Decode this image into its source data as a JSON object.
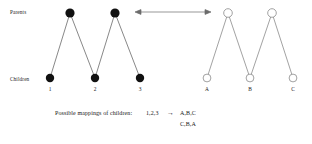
{
  "figure": {
    "row_labels": {
      "parents": "Parents",
      "children": "Children"
    },
    "relation_arrow": "double-headed-arrow",
    "left_graph": {
      "name": "numbered-pedigree",
      "node_style": "filled",
      "node_color": "#111111",
      "edge_color": "#555555",
      "parents": [
        {
          "id": "p1",
          "label": "",
          "x": 70,
          "y": 13
        },
        {
          "id": "p2",
          "label": "",
          "x": 115,
          "y": 13
        }
      ],
      "children": [
        {
          "id": "c1",
          "label": "1",
          "x": 50,
          "y": 78
        },
        {
          "id": "c2",
          "label": "2",
          "x": 95,
          "y": 78
        },
        {
          "id": "c3",
          "label": "3",
          "x": 140,
          "y": 78
        }
      ],
      "edges": [
        {
          "from": "p1",
          "to": "c1"
        },
        {
          "from": "p1",
          "to": "c2"
        },
        {
          "from": "p2",
          "to": "c2"
        },
        {
          "from": "p2",
          "to": "c3"
        }
      ]
    },
    "right_graph": {
      "name": "lettered-pedigree",
      "node_style": "open",
      "node_color": "#ffffff",
      "node_stroke": "#8a8a8a",
      "edge_color": "#7a7a7a",
      "parents": [
        {
          "id": "P1",
          "label": "",
          "x": 228,
          "y": 13
        },
        {
          "id": "P2",
          "label": "",
          "x": 272,
          "y": 13
        }
      ],
      "children": [
        {
          "id": "A",
          "label": "A",
          "x": 207,
          "y": 78
        },
        {
          "id": "B",
          "label": "B",
          "x": 250,
          "y": 78
        },
        {
          "id": "C",
          "label": "C",
          "x": 293,
          "y": 78
        }
      ],
      "edges": [
        {
          "from": "P1",
          "to": "A"
        },
        {
          "from": "P1",
          "to": "B"
        },
        {
          "from": "P2",
          "to": "B"
        },
        {
          "from": "P2",
          "to": "C"
        }
      ]
    },
    "caption": {
      "lead": "Possible mappings of children:",
      "source": "1,2,3",
      "arrow": "→",
      "mapping_1": "A,B,C",
      "mapping_2": "C,B,A"
    }
  }
}
